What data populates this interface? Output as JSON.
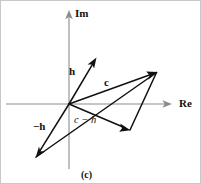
{
  "figure": {
    "caption": "(c)",
    "width": 201,
    "height": 184,
    "background_color": "#ffffff",
    "border_color": "#c8c8c8"
  },
  "axes": {
    "color": "#8c8c8c",
    "origin": {
      "x": 68,
      "y": 103
    },
    "imaginary": {
      "name": "Im",
      "label": "Im",
      "label_x": 74,
      "label_y": 8,
      "from": {
        "x": 68,
        "y": 168
      },
      "to": {
        "x": 68,
        "y": 10
      }
    },
    "real": {
      "name": "Re",
      "label": "Re",
      "label_x": 178,
      "label_y": 97,
      "from": {
        "x": 5,
        "y": 103
      },
      "to": {
        "x": 170,
        "y": 103
      }
    }
  },
  "vectors": [
    {
      "id": "h",
      "label": "h",
      "label_style": "bold",
      "label_x": 68,
      "label_y": 66,
      "color": "#111111",
      "from": {
        "x": 68,
        "y": 103
      },
      "to": {
        "x": 95,
        "y": 57
      }
    },
    {
      "id": "c",
      "label": "c",
      "label_style": "bold",
      "label_x": 103,
      "label_y": 77,
      "color": "#111111",
      "from": {
        "x": 68,
        "y": 103
      },
      "to": {
        "x": 156,
        "y": 71
      }
    },
    {
      "id": "minus-h",
      "label": "−h",
      "label_style": "bold",
      "label_x": 33,
      "label_y": 121,
      "color": "#111111",
      "from": {
        "x": 68,
        "y": 103
      },
      "to": {
        "x": 35,
        "y": 156
      }
    },
    {
      "id": "c-minus-h",
      "label": "c − h",
      "label_style": "italic",
      "label_x": 73,
      "label_y": 115,
      "color": "#111111",
      "from": {
        "x": 68,
        "y": 103
      },
      "to": {
        "x": 129,
        "y": 129
      }
    }
  ],
  "edges": [
    {
      "id": "parallelogram-diagonal",
      "color": "#111111",
      "from": {
        "x": 35,
        "y": 156
      },
      "to": {
        "x": 156,
        "y": 71
      }
    },
    {
      "id": "parallelogram-right-side",
      "color": "#111111",
      "from": {
        "x": 129,
        "y": 129
      },
      "to": {
        "x": 156,
        "y": 71
      }
    }
  ],
  "caption": {
    "text": "(c)",
    "x": 80,
    "y": 169
  }
}
